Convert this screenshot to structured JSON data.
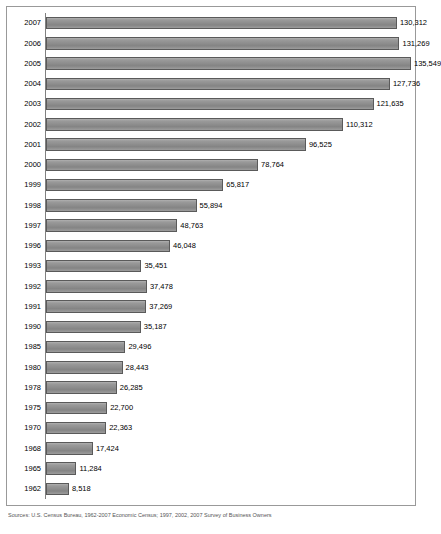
{
  "chart_data": {
    "type": "bar",
    "orientation": "horizontal",
    "title": "",
    "xlabel": "",
    "ylabel": "",
    "grid": false,
    "legend": null,
    "xlim": [
      0,
      135549
    ],
    "categories": [
      "2007",
      "2006",
      "2005",
      "2004",
      "2003",
      "2002",
      "2001",
      "2000",
      "1999",
      "1998",
      "1997",
      "1996",
      "1993",
      "1992",
      "1991",
      "1990",
      "1985",
      "1980",
      "1978",
      "1975",
      "1970",
      "1968",
      "1965",
      "1962"
    ],
    "values": [
      130312,
      131269,
      135549,
      127736,
      121635,
      110312,
      96525,
      78764,
      65817,
      55894,
      48763,
      46048,
      35451,
      37478,
      37269,
      35187,
      29496,
      28443,
      26285,
      22700,
      22363,
      17424,
      11284,
      8518
    ],
    "value_labels": [
      "130,312",
      "131,269",
      "135,549",
      "127,736",
      "121,635",
      "110,312",
      "96,525",
      "78,764",
      "65,817",
      "55,894",
      "48,763",
      "46,048",
      "35,451",
      "37,478",
      "37,269",
      "35,187",
      "29,496",
      "28,443",
      "26,285",
      "22,700",
      "22,363",
      "17,424",
      "11,284",
      "8,518"
    ],
    "bar_color": "#8f8f8f",
    "bar_border_color": "#5a5a5a"
  },
  "footnote": {
    "text": "Sources: U.S. Census Bureau, 1962-2007 Economic Census; 1997, 2002, 2007 Survey of Business Owners"
  }
}
